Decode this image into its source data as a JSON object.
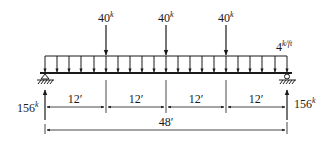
{
  "diagram": {
    "type": "simply-supported-beam",
    "point_loads": [
      {
        "value": "40",
        "unit": "k",
        "x": 106
      },
      {
        "value": "40",
        "unit": "k",
        "x": 166
      },
      {
        "value": "40",
        "unit": "k",
        "x": 226
      }
    ],
    "distributed_load": {
      "value": "4",
      "unit": "k/ft"
    },
    "reactions": {
      "left": {
        "value": "156",
        "unit": "k"
      },
      "right": {
        "value": "156",
        "unit": "k"
      }
    },
    "segment_dimensions": [
      "12′",
      "12′",
      "12′",
      "12′"
    ],
    "total_span": "48′",
    "colors": {
      "line": "#1a1a1a",
      "background": "#ffffff"
    }
  }
}
